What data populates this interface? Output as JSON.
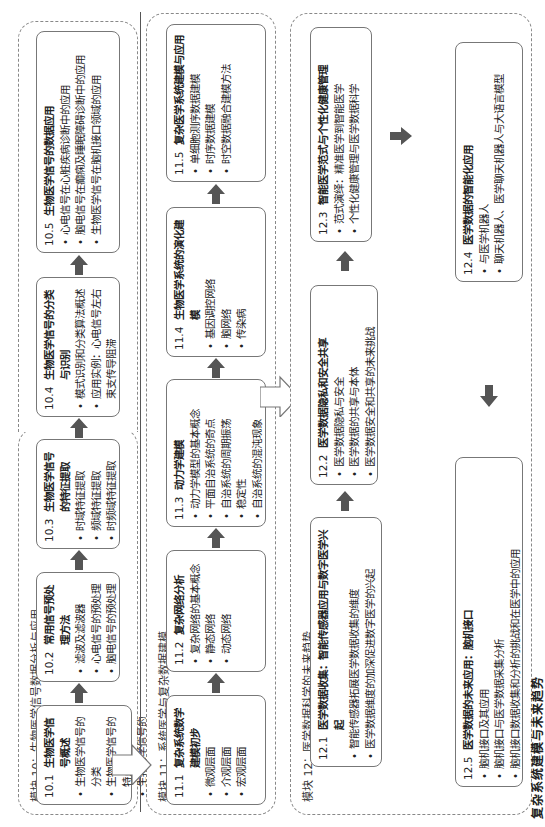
{
  "caption": "复杂系统建模与未来趋势",
  "modules": [
    {
      "title": "模块 10：生物医学信号数据分析与应用",
      "boxes": [
        {
          "num": "10.1",
          "title": "生物医学信号概述",
          "items": [
            "生物医学信号的分类",
            "生物医学信号的特点",
            "生物医学信号的处理流程"
          ]
        },
        {
          "num": "10.2",
          "title": "常用信号预处理方法",
          "items": [
            "滤波及滤波器",
            "心电信号的预处理",
            "脑电信号的预处理"
          ]
        },
        {
          "num": "10.3",
          "title": "生物医学信号的特征提取",
          "items": [
            "时域特征提取",
            "频域特征提取",
            "时频域特征提取"
          ]
        },
        {
          "num": "10.4",
          "title": "生物医学信号的分类与识别",
          "items": [
            "模式识别和分类算法概述",
            "应用实例：心电信号左右束支传导阻滞"
          ]
        },
        {
          "num": "10.5",
          "title": "生物医学信号的数据应用",
          "items": [
            "心电信号在心脏疾病诊断中的应用",
            "脑电信号在癫痫及睡眠障碍诊断中的应用",
            "生物医学信号在脑机接口领域的应用"
          ]
        }
      ]
    },
    {
      "title": "模块 11：系统医学与复杂数据建模",
      "boxes": [
        {
          "num": "11.1",
          "title": "复杂系统数学建模初步",
          "items": [
            "微观层面",
            "介观层面",
            "宏观层面"
          ]
        },
        {
          "num": "11.2",
          "title": "复杂网络分析",
          "items": [
            "复杂网络的基本概念",
            "静态网络",
            "动态网络"
          ]
        },
        {
          "num": "11.3",
          "title": "动力学建模",
          "items": [
            "动力学模型的基本概念",
            "平面自治系统的奇点",
            "自治系统的周期振荡",
            "稳定性",
            "自治系统的混沌现象"
          ]
        },
        {
          "num": "11.4",
          "title": "生物医学系统的演化建模",
          "items": [
            "基因调控网络",
            "脑网络",
            "传染病"
          ]
        },
        {
          "num": "11.5",
          "title": "复杂医学系统建模与应用",
          "items": [
            "单细胞测序数据建模",
            "时序数据建模",
            "时空数据融合建模方法"
          ]
        }
      ]
    },
    {
      "title": "模块 12：医学数据科学的未来趋势",
      "boxes": [
        {
          "num": "12.1",
          "title": "医学数据收集：智能传感器应用与数字医学兴起",
          "items": [
            "智能传感器拓展医学数据收集的维度",
            "医学数据维度的加深促进数字医学的兴起"
          ]
        },
        {
          "num": "12.2",
          "title": "医学数据隐私和安全共享",
          "items": [
            "医学数据隐私与安全",
            "医学数据的共享与本体",
            "医学数据安全和共享的未来挑战"
          ]
        },
        {
          "num": "12.3",
          "title": "智能医学范式与个性化健康管理",
          "items": [
            "范式演绎：精准医学到智能医学",
            "个性化健康管理与医学数据科学"
          ]
        },
        {
          "num": "12.4",
          "title": "医学数据的智能化应用",
          "items": [
            "与医学机器人",
            "聊天机器人、医学聊天机器人与大语言模型"
          ]
        },
        {
          "num": "12.5",
          "title": "医学数据的未来应用：脑机接口",
          "items": [
            "脑机接口及其应用",
            "脑机接口与医学数据采集分析",
            "脑机接口数据收集和分析的挑战和在医学中的应用"
          ]
        }
      ]
    }
  ],
  "colors": {
    "solid_arrow": "#555555",
    "border": "#777777",
    "dashed": "#888888"
  }
}
